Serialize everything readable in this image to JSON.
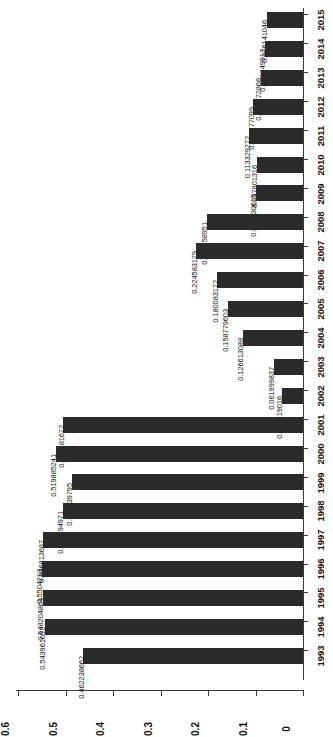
{
  "chart_data": {
    "type": "bar",
    "orientation": "horizontal",
    "rotated_90": true,
    "title": "",
    "subtitle": "",
    "xlabel": "",
    "ylabel": "",
    "grid": false,
    "legend": null,
    "value_axis": {
      "min": 0,
      "max": 0.6,
      "ticks": [
        0,
        0.1,
        0.2,
        0.3,
        0.4,
        0.5,
        0.6
      ],
      "tick_labels": [
        "0",
        "0.1",
        "0.2",
        "0.3",
        "0.4",
        "0.5",
        "0.6"
      ]
    },
    "categories": [
      "1993",
      "1994",
      "1995",
      "1996",
      "1997",
      "1998",
      "1999",
      "2000",
      "2001",
      "2002",
      "2003",
      "2004",
      "2005",
      "2006",
      "2007",
      "2008",
      "2009",
      "2010",
      "2011",
      "2012",
      "2013",
      "2014",
      "2015"
    ],
    "values": [
      0.462238662,
      0.543961052,
      0.548204864,
      0.5504218,
      0.546813687,
      0.505594971,
      0.487139795,
      0.519885241,
      0.504281672,
      0.044219016,
      0.061999837,
      0.126613088,
      0.158779603,
      0.180083172,
      0.224583179,
      0.202158951,
      0.099730615,
      0.097801316,
      0.113329272,
      0.104277099,
      0.088272866,
      0.079849912,
      0.076141046
    ],
    "data_labels": [
      "0.462238662",
      "0.543961052",
      "0.548204864",
      "0.5504218",
      "0.546813687",
      "0.505594971",
      "0.487139795",
      "0.519885241",
      "0.504281672",
      "0.044219016",
      "0.061999837",
      "0.126613088",
      "0.158779603",
      "0.180083172",
      "0.224583179",
      "0.202158951",
      "0.099730615",
      "0.097801316",
      "0.113329272",
      "0.104277099",
      "0.088272866",
      "0.079849912",
      "0.076141046"
    ],
    "bar_color": "#2b2b2b",
    "background_color": "#ffffff"
  }
}
